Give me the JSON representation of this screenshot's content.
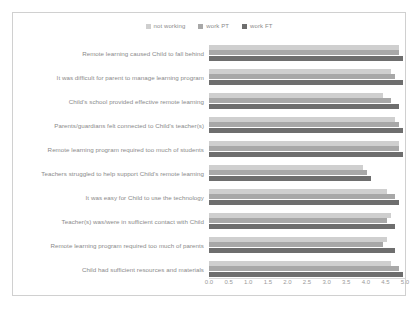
{
  "chart_data": {
    "type": "bar",
    "orientation": "horizontal",
    "title": "",
    "xlabel": "",
    "ylabel": "",
    "xlim": [
      0.0,
      5.0
    ],
    "grid": false,
    "legend_position": "top-center",
    "xticks": [
      "0.0",
      "0.5",
      "1.0",
      "1.5",
      "2.0",
      "2.5",
      "3.0",
      "3.5",
      "4.0",
      "4.5",
      "5.0"
    ],
    "xtick_values": [
      0.0,
      0.5,
      1.0,
      1.5,
      2.0,
      2.5,
      3.0,
      3.5,
      4.0,
      4.5,
      5.0
    ],
    "categories": [
      "Remote learning caused Child to fall behind",
      "It was difficult for parent to manage learning program",
      "Child's school provided effective remote learning",
      "Parents/guardians felt connected to Child's teacher(s)",
      "Remote learning program required too much of students",
      "Teachers struggled to help support Child's remote learning",
      "It was easy for Child to use the technology",
      "Teacher(s) was/were in sufficient contact with Child",
      "Remote learning program required too much of parents",
      "Child had sufficient resources and materials"
    ],
    "series": [
      {
        "name": "not working",
        "color": "#cfcfcf",
        "values": [
          4.8,
          4.6,
          4.4,
          4.7,
          4.8,
          3.9,
          4.5,
          4.6,
          4.5,
          4.6
        ]
      },
      {
        "name": "work PT",
        "color": "#a8a8a8",
        "values": [
          4.8,
          4.7,
          4.6,
          4.8,
          4.8,
          4.0,
          4.7,
          4.5,
          4.4,
          4.8
        ]
      },
      {
        "name": "work FT",
        "color": "#6e6e6e",
        "values": [
          4.9,
          4.9,
          4.8,
          4.9,
          4.9,
          4.1,
          4.8,
          4.7,
          4.7,
          4.9
        ]
      }
    ]
  }
}
